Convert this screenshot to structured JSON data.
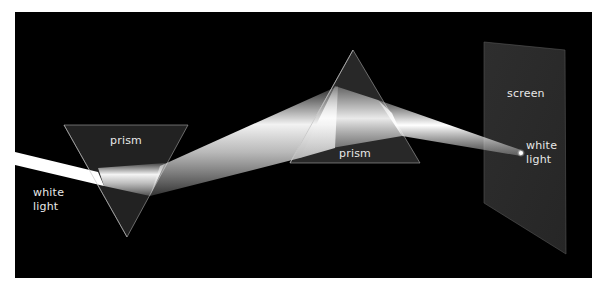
{
  "diagram": {
    "title": "",
    "background_color": "#000000",
    "labels": {
      "input_light_line1": "white",
      "input_light_line2": "light",
      "prism1": "prism",
      "prism2": "prism",
      "screen": "screen",
      "output_light_line1": "white",
      "output_light_line2": "light"
    },
    "elements": [
      {
        "type": "beam",
        "name": "incoming-white-light"
      },
      {
        "type": "prism",
        "name": "prism-1",
        "orientation": "inverted"
      },
      {
        "type": "beam",
        "name": "dispersed-spectrum"
      },
      {
        "type": "prism",
        "name": "prism-2",
        "orientation": "upright"
      },
      {
        "type": "beam",
        "name": "recombined-beam"
      },
      {
        "type": "screen",
        "name": "screen"
      }
    ],
    "colors": {
      "prism_fill": "#2a2a2a",
      "prism_edge": "#bdbdbd",
      "screen_fill": "#2b2b2b",
      "beam": "#ffffff",
      "label": "#e8e8e8"
    }
  }
}
